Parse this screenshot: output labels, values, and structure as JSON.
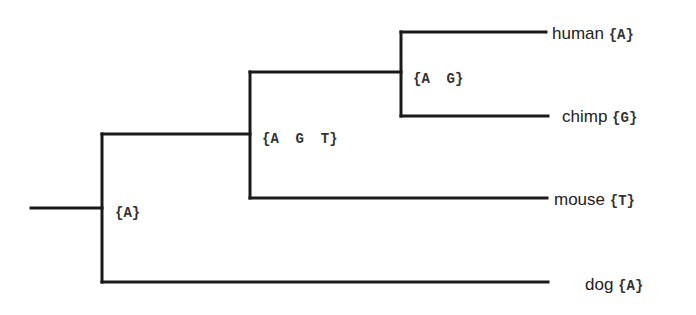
{
  "diagram": {
    "type": "phylogenetic-tree",
    "leaves": [
      {
        "name": "human",
        "state": "{A}"
      },
      {
        "name": "chimp",
        "state": "{G}"
      },
      {
        "name": "mouse",
        "state": "{T}"
      },
      {
        "name": "dog",
        "state": "{A}"
      }
    ],
    "internal_nodes": [
      {
        "id": "human-chimp",
        "state_set": "{A  G}"
      },
      {
        "id": "primates-mouse",
        "state_set": "{A  G  T}"
      },
      {
        "id": "root",
        "state_set": "{A}"
      }
    ],
    "colors": {
      "line": "#1a1a1a",
      "text": "#222222",
      "background": "#ffffff"
    }
  }
}
